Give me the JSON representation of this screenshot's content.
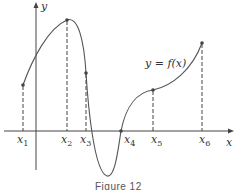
{
  "figure": {
    "caption": "Figure 12",
    "curve_label": "y = f(x)",
    "axis_labels": {
      "x": "x",
      "y": "y"
    },
    "points": [
      {
        "name": "x",
        "sub": "1"
      },
      {
        "name": "x",
        "sub": "2"
      },
      {
        "name": "x",
        "sub": "3"
      },
      {
        "name": "x",
        "sub": "4"
      },
      {
        "name": "x",
        "sub": "5"
      },
      {
        "name": "x",
        "sub": "6"
      }
    ]
  }
}
